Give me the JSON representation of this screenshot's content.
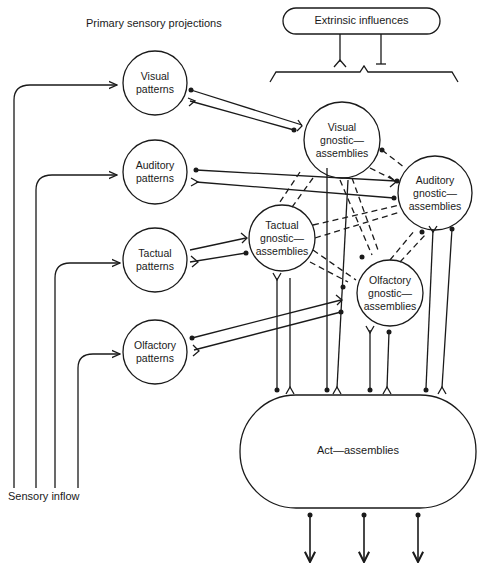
{
  "labels": {
    "primary_projections": "Primary sensory projections",
    "extrinsic_influences": "Extrinsic influences",
    "sensory_inflow": "Sensory inflow",
    "act_assemblies": "Act—assemblies"
  },
  "pattern_nodes": [
    {
      "id": "visual-patterns",
      "line1": "Visual",
      "line2": "patterns"
    },
    {
      "id": "auditory-patterns",
      "line1": "Auditory",
      "line2": "patterns"
    },
    {
      "id": "tactual-patterns",
      "line1": "Tactual",
      "line2": "patterns"
    },
    {
      "id": "olfactory-patterns",
      "line1": "Olfactory",
      "line2": "patterns"
    }
  ],
  "gnostic_nodes": [
    {
      "id": "visual-gnostic",
      "line1": "Visual",
      "line2": "gnostic—",
      "line3": "assemblies"
    },
    {
      "id": "auditory-gnostic",
      "line1": "Auditory",
      "line2": "gnostic—",
      "line3": "assemblies"
    },
    {
      "id": "tactual-gnostic",
      "line1": "Tactual",
      "line2": "gnostic—",
      "line3": "assemblies"
    },
    {
      "id": "olfactory-gnostic",
      "line1": "Olfactory",
      "line2": "gnostic—",
      "line3": "assemblies"
    }
  ],
  "legend": {
    "excitatory_terminal": "fork (Y) ending",
    "inhibitory_terminal": "dot ending"
  },
  "colors": {
    "ink": "#1a1a1a",
    "background": "#ffffff"
  }
}
